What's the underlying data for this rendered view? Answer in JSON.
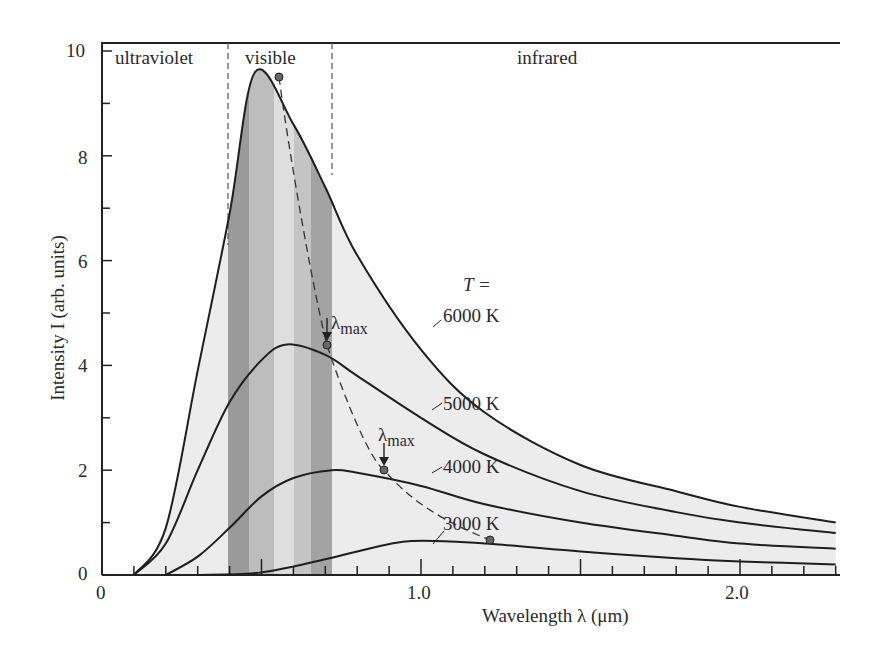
{
  "chart_data": {
    "type": "line",
    "title": "",
    "xlabel": "Wavelength λ (μm)",
    "ylabel": "Intensity I (arb. units)",
    "xlim": [
      0,
      2.3
    ],
    "ylim": [
      0,
      10
    ],
    "x_ticks": [
      "0",
      "1.0",
      "2.0"
    ],
    "y_ticks": [
      "0",
      "2",
      "4",
      "6",
      "8",
      "10"
    ],
    "grid": false,
    "regions": [
      {
        "label": "ultraviolet",
        "x_range": [
          0,
          0.4
        ]
      },
      {
        "label": "visible",
        "x_range": [
          0.4,
          0.7
        ]
      },
      {
        "label": "infrared",
        "x_range": [
          0.7,
          2.3
        ]
      }
    ],
    "legend_header": "T =",
    "series": [
      {
        "name": "6000 K",
        "peak_x": 0.48,
        "peak_y": 9.6,
        "x": [
          0.1,
          0.2,
          0.3,
          0.4,
          0.48,
          0.6,
          0.7,
          0.8,
          1.0,
          1.2,
          1.5,
          1.8,
          2.0,
          2.3
        ],
        "y": [
          0.0,
          0.9,
          3.9,
          6.9,
          9.6,
          8.6,
          7.4,
          6.1,
          4.3,
          3.1,
          2.1,
          1.6,
          1.3,
          1.0
        ]
      },
      {
        "name": "5000 K",
        "peak_x": 0.58,
        "peak_y": 4.4,
        "x": [
          0.1,
          0.2,
          0.3,
          0.4,
          0.5,
          0.58,
          0.7,
          0.8,
          1.0,
          1.2,
          1.5,
          1.8,
          2.0,
          2.3
        ],
        "y": [
          0.0,
          0.6,
          2.0,
          3.3,
          4.1,
          4.4,
          4.2,
          3.8,
          3.0,
          2.3,
          1.6,
          1.2,
          1.0,
          0.8
        ]
      },
      {
        "name": "4000 K",
        "peak_x": 0.72,
        "peak_y": 2.0,
        "x": [
          0.2,
          0.3,
          0.4,
          0.5,
          0.6,
          0.72,
          0.8,
          1.0,
          1.2,
          1.5,
          1.8,
          2.0,
          2.3
        ],
        "y": [
          0.0,
          0.35,
          0.9,
          1.5,
          1.85,
          2.0,
          1.95,
          1.7,
          1.35,
          1.0,
          0.75,
          0.6,
          0.5
        ]
      },
      {
        "name": "3000 K",
        "peak_x": 0.97,
        "peak_y": 0.65,
        "x": [
          0.3,
          0.5,
          0.7,
          0.8,
          0.97,
          1.2,
          1.5,
          1.8,
          2.0,
          2.3
        ],
        "y": [
          0.0,
          0.05,
          0.3,
          0.45,
          0.65,
          0.6,
          0.45,
          0.32,
          0.26,
          0.2
        ]
      }
    ],
    "annotations": [
      {
        "text": "λmax",
        "x": 0.58,
        "y": 4.4
      },
      {
        "text": "λmax",
        "x": 0.72,
        "y": 2.0
      },
      {
        "text": "Wien peak locus (dashed)",
        "points": [
          [
            0.48,
            9.6
          ],
          [
            0.58,
            4.4
          ],
          [
            0.72,
            2.0
          ],
          [
            0.97,
            0.65
          ]
        ]
      }
    ]
  },
  "labels": {
    "ultraviolet": "ultraviolet",
    "visible": "visible",
    "infrared": "infrared",
    "t_equals": "T =",
    "lambda_max_1": "λ",
    "lambda_max_sub_1": "max",
    "lambda_max_2": "λ",
    "lambda_max_sub_2": "max",
    "s6000": "6000 K",
    "s5000": "5000 K",
    "s4000": "4000 K",
    "s3000": "3000 K",
    "xlabel": "Wavelength  λ  (μm)",
    "ylabel": "Intensity  I  (arb. units)",
    "x0": "0",
    "x1": "1.0",
    "x2": "2.0",
    "y0": "0",
    "y2": "2",
    "y4": "4",
    "y6": "6",
    "y8": "8",
    "y10": "10"
  }
}
